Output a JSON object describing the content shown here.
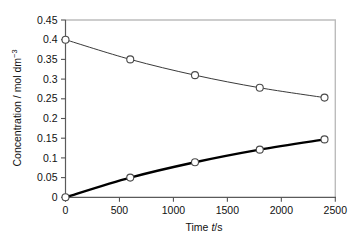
{
  "chart_data": {
    "type": "line",
    "title": "",
    "xlabel": "Time t/s",
    "ylabel": "Concentration / mol dm−3",
    "ylabel_parts": {
      "main": "Concentration / mol dm",
      "superscript": "−3"
    },
    "xlabel_parts": {
      "prefix": "Time ",
      "italic": "t",
      "suffix": "/s"
    },
    "xlim": [
      0,
      2500
    ],
    "ylim": [
      0,
      0.45
    ],
    "xticks": [
      0,
      500,
      1000,
      1500,
      2000,
      2500
    ],
    "xtick_labels": [
      "0",
      "500",
      "1000",
      "1500",
      "2000",
      "2500"
    ],
    "yticks": [
      0,
      0.05,
      0.1,
      0.15,
      0.2,
      0.25,
      0.3,
      0.35,
      0.4,
      0.45
    ],
    "ytick_labels": [
      "0",
      "0.05",
      "0.1",
      "0.15",
      "0.2",
      "0.25",
      "0.3",
      "0.35",
      "0.4",
      "0.45"
    ],
    "grid": false,
    "legend": null,
    "x": [
      0,
      600,
      1200,
      1800,
      2400
    ],
    "series": [
      {
        "name": "reactant",
        "marker": "open-circle",
        "line_width_px": 1.0,
        "color": "#3a3a3a",
        "values": [
          0.4,
          0.35,
          0.31,
          0.278,
          0.253
        ]
      },
      {
        "name": "product",
        "marker": "open-circle",
        "line_width_px": 2.4,
        "color": "#000000",
        "values": [
          0.0,
          0.05,
          0.089,
          0.121,
          0.147
        ]
      }
    ],
    "colors": {
      "axis": "#555555",
      "frame": "#b9b9b9",
      "text": "#111111",
      "series_upper": "#3a3a3a",
      "series_lower": "#000000",
      "background": "#ffffff"
    }
  }
}
